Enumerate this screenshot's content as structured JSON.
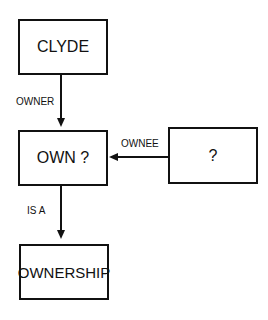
{
  "nodes": {
    "clyde": {
      "label": "CLYDE"
    },
    "own": {
      "label": "OWN ?"
    },
    "unknown": {
      "label": "?"
    },
    "ownership": {
      "label": "OWNERSHIP"
    }
  },
  "edges": {
    "owner": {
      "label": "OWNER"
    },
    "ownee": {
      "label": "OWNEE"
    },
    "is_a": {
      "label": "IS A"
    }
  }
}
